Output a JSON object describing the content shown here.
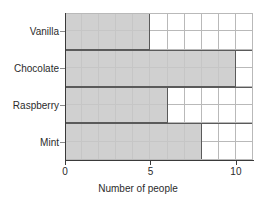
{
  "chart_data": {
    "type": "bar",
    "orientation": "horizontal",
    "title": "",
    "xlabel": "Number of people",
    "ylabel": "",
    "categories": [
      "Vanilla",
      "Chocolate",
      "Raspberry",
      "Mint"
    ],
    "values": [
      5,
      10,
      6,
      8
    ],
    "xlim": [
      0,
      11
    ],
    "xticks": [
      0,
      5,
      10
    ],
    "xtick_labels": [
      "0",
      "5",
      "10"
    ],
    "grid": true,
    "grid_minor_step": 1,
    "legend": null,
    "bar_fill_color": "#c8c8c8",
    "bar_border_color": "#5a5a5a",
    "grid_color": "#b9b9b9",
    "axis_color": "#3a3a3a"
  },
  "axis": {
    "x_title": "Number of people",
    "ticks": [
      {
        "label": "0",
        "value": 0
      },
      {
        "label": "5",
        "value": 5
      },
      {
        "label": "10",
        "value": 10
      }
    ]
  },
  "bars": [
    {
      "label": "Vanilla",
      "value": 5
    },
    {
      "label": "Chocolate",
      "value": 10
    },
    {
      "label": "Raspberry",
      "value": 6
    },
    {
      "label": "Mint",
      "value": 8
    }
  ]
}
